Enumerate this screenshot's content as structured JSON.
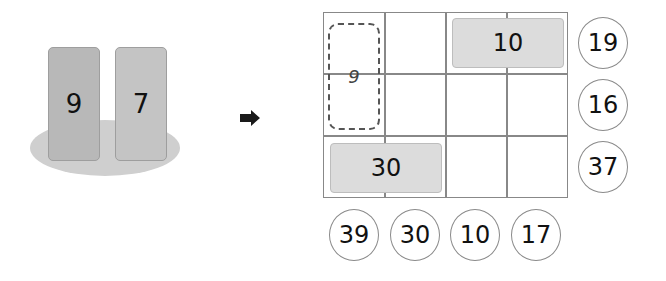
{
  "left_panel": {
    "cards": [
      {
        "value": "9"
      },
      {
        "value": "7"
      }
    ]
  },
  "arrow": {
    "icon": "right-arrow-icon"
  },
  "grid": {
    "rows": 3,
    "cols": 4,
    "sketch_tile": {
      "value": "9",
      "position": "col 1, rows 1-2",
      "style": "hand-drawn vertical outline"
    },
    "tiles": [
      {
        "value": "10",
        "position": "row 1, cols 3-4"
      },
      {
        "value": "30",
        "position": "row 3, cols 1-2"
      }
    ]
  },
  "row_sums": [
    "19",
    "16",
    "37"
  ],
  "col_sums": [
    "39",
    "30",
    "10",
    "17"
  ]
}
